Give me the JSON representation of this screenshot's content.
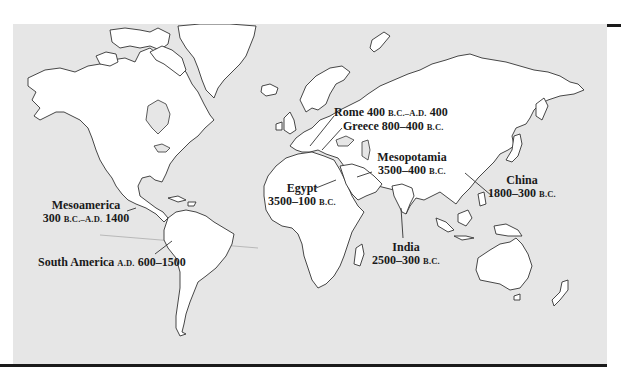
{
  "map": {
    "title": "Early civilizations world map",
    "colors": {
      "ocean": "#e6e6e6",
      "land": "#ffffff",
      "outline": "#333333",
      "rule": "#1a1a1a",
      "text": "#1a1a1a"
    },
    "civilizations": [
      {
        "id": "rome",
        "name": "Rome",
        "dates": {
          "start": "400",
          "start_era": "B.C.",
          "sep": "–",
          "end_era": "A.D.",
          "end": "400"
        }
      },
      {
        "id": "greece",
        "name": "Greece",
        "dates": {
          "range": "800–400",
          "era": "B.C."
        }
      },
      {
        "id": "mesopotamia",
        "name": "Mesopotamia",
        "dates": {
          "range": "3500–400",
          "era": "B.C."
        }
      },
      {
        "id": "egypt",
        "name": "Egypt",
        "dates": {
          "range": "3500–100",
          "era": "B.C."
        }
      },
      {
        "id": "india",
        "name": "India",
        "dates": {
          "range": "2500–300",
          "era": "B.C."
        }
      },
      {
        "id": "china",
        "name": "China",
        "dates": {
          "range": "1800–300",
          "era": "B.C."
        }
      },
      {
        "id": "mesoamerica",
        "name": "Mesoamerica",
        "dates": {
          "start": "300",
          "start_era": "B.C.",
          "sep": "–",
          "end_era": "A.D.",
          "end": "1400"
        }
      },
      {
        "id": "south-america",
        "name": "South America",
        "dates": {
          "era": "A.D.",
          "range": "600–1500"
        }
      }
    ]
  }
}
